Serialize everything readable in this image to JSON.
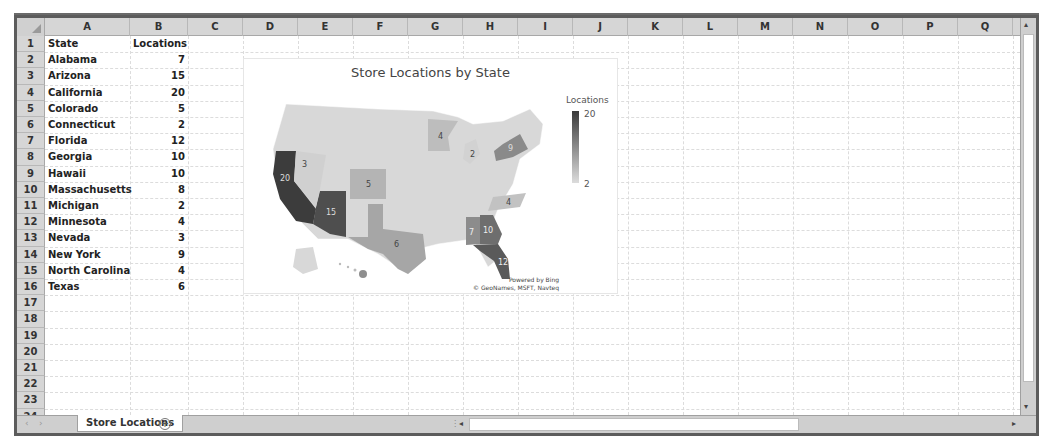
{
  "spreadsheet": {
    "columns": [
      "A",
      "B",
      "C",
      "D",
      "E",
      "F",
      "G",
      "H",
      "I",
      "J",
      "K",
      "L",
      "M",
      "N",
      "O",
      "P",
      "Q"
    ],
    "rows": [
      "1",
      "2",
      "3",
      "4",
      "5",
      "6",
      "7",
      "8",
      "9",
      "10",
      "11",
      "12",
      "13",
      "14",
      "15",
      "16",
      "17",
      "18",
      "19",
      "20",
      "21",
      "22",
      "23",
      "24"
    ],
    "headers": {
      "state": "State",
      "locations": "Locations"
    },
    "data": [
      {
        "state": "Alabama",
        "locations": "7"
      },
      {
        "state": "Arizona",
        "locations": "15"
      },
      {
        "state": "California",
        "locations": "20"
      },
      {
        "state": "Colorado",
        "locations": "5"
      },
      {
        "state": "Connecticut",
        "locations": "2"
      },
      {
        "state": "Florida",
        "locations": "12"
      },
      {
        "state": "Georgia",
        "locations": "10"
      },
      {
        "state": "Hawaii",
        "locations": "10"
      },
      {
        "state": "Massachusetts",
        "locations": "8"
      },
      {
        "state": "Michigan",
        "locations": "2"
      },
      {
        "state": "Minnesota",
        "locations": "4"
      },
      {
        "state": "Nevada",
        "locations": "3"
      },
      {
        "state": "New York",
        "locations": "9"
      },
      {
        "state": "North Carolina",
        "locations": "4"
      },
      {
        "state": "Texas",
        "locations": "6"
      }
    ]
  },
  "chart": {
    "title": "Store Locations by State",
    "legend_title": "Locations",
    "legend_max": "20",
    "legend_min": "2",
    "attribution_line1": "Powered by Bing",
    "attribution_line2": "© GeoNames, MSFT, Navteq",
    "labels": {
      "CA": "20",
      "NV": "3",
      "AZ": "15",
      "CO": "5",
      "TX": "6",
      "MN": "4",
      "MI": "2",
      "NY": "9",
      "NC": "4",
      "AL": "7",
      "GA": "10",
      "FL": "12"
    },
    "colors": {
      "min": "#dcdcdc",
      "max": "#3a3a3a",
      "base": "#d8d8d8"
    }
  },
  "bottom_bar": {
    "sheet_tab": "Store Locations",
    "add_sheet": "+",
    "nav_prev": "‹",
    "nav_next": "›",
    "scroll_left": "◂",
    "scroll_right": "▸"
  },
  "vscroll": {
    "up": "▴",
    "down": "▾"
  }
}
